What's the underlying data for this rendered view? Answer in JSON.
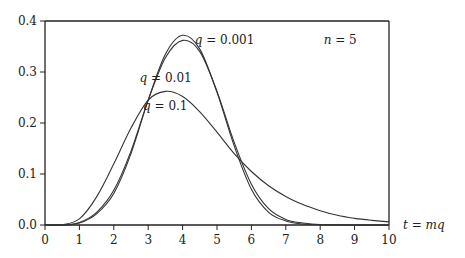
{
  "chart_data": {
    "type": "line",
    "title": "",
    "xlabel": "t = mq",
    "ylabel": "",
    "xlim": [
      0,
      10
    ],
    "ylim": [
      0,
      0.4
    ],
    "grid": false,
    "x_ticks": [
      "0",
      "1",
      "2",
      "3",
      "4",
      "5",
      "6",
      "7",
      "8",
      "9",
      "10"
    ],
    "y_ticks": [
      "0.0",
      "0.1",
      "0.2",
      "0.3",
      "0.4"
    ],
    "annotations": [
      {
        "text": "n = 5",
        "x": 8.1,
        "y": 0.355
      },
      {
        "text": "q = 0.001",
        "x": 4.35,
        "y": 0.355
      },
      {
        "text": "q = 0.01",
        "x": 2.75,
        "y": 0.28
      },
      {
        "text": "q = 0.1",
        "x": 2.85,
        "y": 0.225
      }
    ],
    "series": [
      {
        "name": "q = 0.001",
        "x": [
          0,
          0.5,
          1,
          1.5,
          2,
          2.5,
          3,
          3.5,
          4,
          4.5,
          5,
          5.5,
          6,
          6.5,
          7,
          7.5,
          8,
          9,
          10
        ],
        "y": [
          0,
          0,
          0.004,
          0.022,
          0.062,
          0.14,
          0.245,
          0.335,
          0.372,
          0.345,
          0.26,
          0.155,
          0.07,
          0.025,
          0.008,
          0.002,
          0.0005,
          0,
          0
        ]
      },
      {
        "name": "q = 0.01",
        "x": [
          0,
          0.5,
          1,
          1.5,
          2,
          2.5,
          3,
          3.5,
          4,
          4.5,
          5,
          5.5,
          6,
          6.5,
          7,
          7.5,
          8,
          9,
          10
        ],
        "y": [
          0,
          0,
          0.005,
          0.025,
          0.068,
          0.145,
          0.245,
          0.328,
          0.362,
          0.34,
          0.262,
          0.162,
          0.08,
          0.032,
          0.011,
          0.004,
          0.001,
          0,
          0
        ]
      },
      {
        "name": "q = 0.1",
        "x": [
          0,
          0.5,
          1,
          1.5,
          2,
          2.5,
          3,
          3.5,
          4,
          4.5,
          5,
          5.5,
          6,
          6.5,
          7,
          7.5,
          8,
          8.5,
          9,
          9.5,
          10
        ],
        "y": [
          0,
          0.0005,
          0.012,
          0.055,
          0.12,
          0.19,
          0.245,
          0.262,
          0.252,
          0.222,
          0.182,
          0.14,
          0.105,
          0.077,
          0.056,
          0.04,
          0.028,
          0.019,
          0.013,
          0.009,
          0.006
        ]
      }
    ]
  },
  "colors": {
    "axis": "#222222",
    "curve": "#333333",
    "background": "#ffffff"
  }
}
